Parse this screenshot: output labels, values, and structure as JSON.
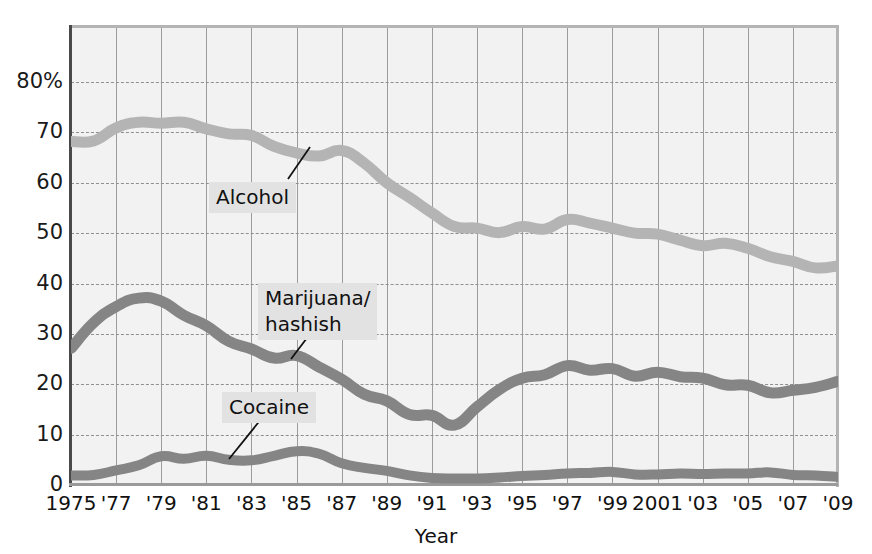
{
  "chart_data": {
    "type": "line",
    "title": "",
    "xlabel": "Year",
    "ylabel": "",
    "ylim": [
      0,
      88
    ],
    "xlim": [
      1975,
      2009
    ],
    "grid": true,
    "legend_position": "inline-annotations",
    "ytick_labels": [
      "0",
      "10",
      "20",
      "30",
      "40",
      "50",
      "60",
      "70",
      "80%"
    ],
    "ytick_values": [
      0,
      10,
      20,
      30,
      40,
      50,
      60,
      70,
      80
    ],
    "xtick_labels": [
      "1975",
      "'77",
      "'79",
      "'81",
      "'83",
      "'85",
      "'87",
      "'89",
      "'91",
      "'93",
      "'95",
      "'97",
      "'99",
      "2001",
      "'03",
      "'05",
      "'07",
      "'09"
    ],
    "xtick_values": [
      1975,
      1977,
      1979,
      1981,
      1983,
      1985,
      1987,
      1989,
      1991,
      1993,
      1995,
      1997,
      1999,
      2001,
      2003,
      2005,
      2007,
      2009
    ],
    "x": [
      1975,
      1976,
      1977,
      1978,
      1979,
      1980,
      1981,
      1982,
      1983,
      1984,
      1985,
      1986,
      1987,
      1988,
      1989,
      1990,
      1991,
      1992,
      1993,
      1994,
      1995,
      1996,
      1997,
      1998,
      1999,
      2000,
      2001,
      2002,
      2003,
      2004,
      2005,
      2006,
      2007,
      2008,
      2009
    ],
    "series": [
      {
        "name": "Alcohol",
        "color": "#b4b4b4",
        "values": [
          68.2,
          68.3,
          70.9,
          72.0,
          71.8,
          72.0,
          70.7,
          69.7,
          69.4,
          67.2,
          65.9,
          65.3,
          66.4,
          63.9,
          60.0,
          57.1,
          54.0,
          51.3,
          51.0,
          50.1,
          51.3,
          50.8,
          52.7,
          52.0,
          51.0,
          50.0,
          49.8,
          48.6,
          47.5,
          48.0,
          47.0,
          45.3,
          44.4,
          43.1,
          43.5
        ]
      },
      {
        "name": "Marijuana/\nhashish",
        "color": "#858585",
        "values": [
          27.1,
          32.2,
          35.4,
          37.1,
          36.5,
          33.7,
          31.6,
          28.5,
          27.0,
          25.2,
          25.7,
          23.4,
          21.0,
          18.0,
          16.7,
          14.0,
          13.8,
          11.9,
          15.5,
          19.0,
          21.2,
          21.9,
          23.7,
          22.8,
          23.1,
          21.6,
          22.4,
          21.5,
          21.2,
          19.9,
          19.8,
          18.3,
          18.8,
          19.4,
          20.6
        ]
      },
      {
        "name": "Cocaine",
        "color": "#858585",
        "values": [
          1.9,
          2.0,
          2.9,
          3.9,
          5.7,
          5.2,
          5.8,
          5.0,
          4.9,
          5.8,
          6.7,
          6.2,
          4.3,
          3.4,
          2.8,
          1.9,
          1.4,
          1.3,
          1.3,
          1.5,
          1.8,
          2.0,
          2.3,
          2.4,
          2.6,
          2.1,
          2.1,
          2.3,
          2.2,
          2.3,
          2.3,
          2.5,
          2.0,
          1.9,
          1.6
        ]
      }
    ],
    "annotations": [
      {
        "id": "alcohol",
        "text": "Alcohol",
        "leader": true
      },
      {
        "id": "marijuana",
        "text": "Marijuana/\nhashish",
        "leader": true
      },
      {
        "id": "cocaine",
        "text": "Cocaine",
        "leader": true
      }
    ],
    "colors": {
      "alcohol": "#b4b4b4",
      "marijuana": "#858585",
      "cocaine": "#858585",
      "plot_background": "#f2f2f2",
      "gridline": "#8f8f8f",
      "axis": "#4a4a4a",
      "annotation_background": "#e2e2e2",
      "text": "#111111"
    }
  }
}
